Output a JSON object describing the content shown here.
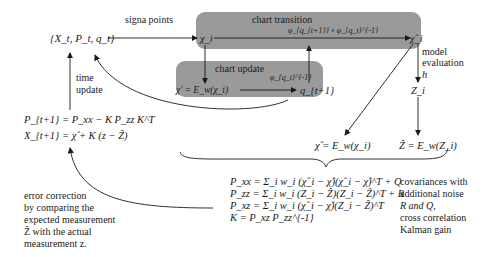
{
  "nodes": {
    "state": "{X_t, P_t, q_t}",
    "chi": "χ_i",
    "chi_hat": "χ̂_i",
    "chi_prime": "χ' = E_w(χ_i)",
    "q_next": "q_{t+1}",
    "z_i": "Z_i",
    "chi_mean": "χ̂ = E_w(χ_i)",
    "z_mean": "Ẑ = E_w(Z_i)"
  },
  "boxes": {
    "chart_transition": "chart transition",
    "chart_update": "chart update"
  },
  "edge_labels": {
    "sigma_points": "signa points",
    "phi_transition": "φ_{q_{t+1}} ∘ φ_{q_t}^{-1}",
    "phi_update": "φ_{q_t}^{-1}",
    "model_evaluation_line1": "model",
    "model_evaluation_line2": "evaluation",
    "h": "h",
    "time_update_line1": "time",
    "time_update_line2": "update"
  },
  "update_equations": {
    "p_next": "P_{t+1} = P_xx − K P_zz K^T",
    "x_next": "X_{t+1} = χ̂ + K (z − Ẑ)"
  },
  "covariance_equations": [
    "P_xx = Σ_i w_i (χ̂_i − χ̂)(χ̂_i − χ̂)^T + Q",
    "P_zz = Σ_i w_i (Z_i − Ẑ)(Z_i − Ẑ)^T + R",
    "P_xz = Σ_i w_i (χ̂_i − χ̂)(Z_i − Ẑ)^T",
    "K = P_xz P_zz^{-1}"
  ],
  "annotations": {
    "covariance_note": [
      "covariances with",
      "additional noise",
      "R and Q,",
      "cross correlation",
      "Kalman gain"
    ],
    "error_correction_note": [
      "error correction",
      "by comparing the",
      "expected measurement",
      "Ẑ with the actual",
      "measurement z."
    ]
  },
  "colors": {
    "box_fill": "#9a9a9a",
    "line": "#1a1a1a"
  }
}
